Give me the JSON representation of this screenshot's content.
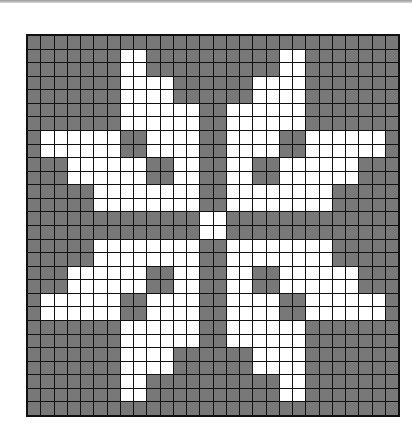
{
  "pattern": {
    "title": "",
    "columns": 28,
    "rows": 28,
    "colors": {
      "background": "#7c7c7c",
      "motif": "#ffffff",
      "grid_lines": "#111111"
    },
    "legend": {
      "1": "motif (white)",
      "0": "background (gray)"
    },
    "grid": [
      "0000000000000000000000000000",
      "0000000110000000000110000000",
      "0000000110000000000110000000",
      "0000000111100000011110000000",
      "0000000111100000011110000000",
      "0000000111111001111110000000",
      "0000000111111001111110000000",
      "0111111001111001111001111110",
      "0111111001111001111001111110",
      "0001111110011001100111111000",
      "0001111110011001100111111000",
      "0000011111111001111111100000",
      "0000011111111001111111100000",
      "0000000000000110000000000000",
      "0000000000000110000000000000",
      "0000011111111001111111100000",
      "0000011111111001111111100000",
      "0001111110011001100111111000",
      "0001111110011001100111111000",
      "0111111001111001111001111110",
      "0111111001111001111001111110",
      "0000000111111001111110000000",
      "0000000111111001111110000000",
      "0000000111100000011110000000",
      "0000000111100000011110000000",
      "0000000110000000000110000000",
      "0000000110000000000110000000",
      "0000000000000000000000000000"
    ]
  }
}
